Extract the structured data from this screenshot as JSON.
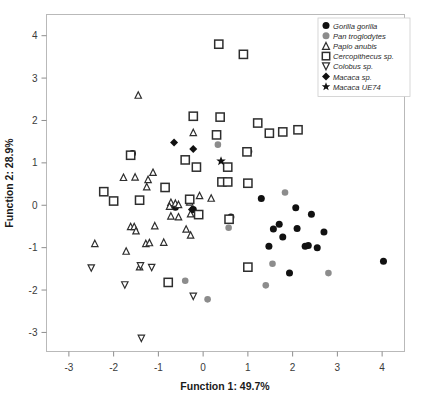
{
  "chart_data": {
    "type": "scatter",
    "title": "",
    "xlabel": "Function 1: 49.7%",
    "ylabel": "Function 2: 28.9%",
    "xlim": [
      -3.5,
      4.5
    ],
    "ylim": [
      -3.45,
      4.5
    ],
    "xticks": [
      -3,
      -2,
      -1,
      0,
      1,
      2,
      3,
      4
    ],
    "yticks": [
      -3,
      -2,
      -1,
      0,
      1,
      2,
      3,
      4
    ],
    "xtick_labels": [
      "-3",
      "-2",
      "-1",
      "0",
      "1",
      "2",
      "3",
      "4"
    ],
    "ytick_labels": [
      "-3",
      "-2",
      "-1",
      "0",
      "1",
      "2",
      "3",
      "4"
    ],
    "grid": false,
    "legend_position": "top-right",
    "series": [
      {
        "name": "Gorilla gorilla",
        "marker": "circle-filled",
        "color": "#111111",
        "size": 7.0,
        "points": [
          [
            -0.62,
            -0.05
          ],
          [
            -0.22,
            -0.1
          ],
          [
            0.62,
            -0.28
          ],
          [
            1.02,
            1.27
          ],
          [
            1.3,
            0.16
          ],
          [
            1.47,
            -0.97
          ],
          [
            1.57,
            -0.56
          ],
          [
            1.7,
            -0.45
          ],
          [
            1.78,
            -0.75
          ],
          [
            1.93,
            -1.6
          ],
          [
            2.07,
            -0.06
          ],
          [
            2.1,
            -0.55
          ],
          [
            2.28,
            -0.97
          ],
          [
            2.35,
            -0.95
          ],
          [
            2.42,
            -0.21
          ],
          [
            2.55,
            -1.0
          ],
          [
            2.7,
            -0.63
          ],
          [
            4.03,
            -1.32
          ],
          [
            -1.58,
            1.22
          ]
        ]
      },
      {
        "name": "Pan troglodytes",
        "marker": "circle-filled",
        "color": "#8c8c8c",
        "size": 6.6,
        "points": [
          [
            0.33,
            1.43
          ],
          [
            -0.4,
            -1.78
          ],
          [
            0.1,
            -2.22
          ],
          [
            0.57,
            -0.53
          ],
          [
            1.4,
            -1.89
          ],
          [
            1.55,
            -1.38
          ],
          [
            1.83,
            0.3
          ],
          [
            2.8,
            -1.6
          ]
        ]
      },
      {
        "name": "Papio anubis",
        "marker": "triangle-up-open",
        "color": "#2e2e2e",
        "size": 6.4,
        "points": [
          [
            -1.45,
            2.6
          ],
          [
            -0.22,
            1.72
          ],
          [
            -1.12,
            0.78
          ],
          [
            -1.78,
            0.66
          ],
          [
            -1.52,
            0.67
          ],
          [
            -1.23,
            0.61
          ],
          [
            -1.26,
            0.44
          ],
          [
            -0.72,
            0.07
          ],
          [
            -0.75,
            -0.02
          ],
          [
            -0.62,
            0.05
          ],
          [
            -0.55,
            0.02
          ],
          [
            -0.3,
            0.08
          ],
          [
            -0.08,
            0.23
          ],
          [
            0.18,
            0.17
          ],
          [
            -0.72,
            -0.25
          ],
          [
            -0.55,
            -0.27
          ],
          [
            -0.28,
            -0.2
          ],
          [
            -1.62,
            -0.5
          ],
          [
            -1.54,
            -0.5
          ],
          [
            -1.5,
            -0.6
          ],
          [
            -1.08,
            -0.48
          ],
          [
            -0.38,
            -0.56
          ],
          [
            -0.28,
            -0.7
          ],
          [
            -2.42,
            -0.9
          ],
          [
            -1.28,
            -0.9
          ],
          [
            -1.2,
            -0.88
          ],
          [
            -0.88,
            -0.87
          ],
          [
            -1.72,
            -1.08
          ],
          [
            -1.42,
            -1.45
          ]
        ]
      },
      {
        "name": "Cercopithecus sp.",
        "marker": "square-open",
        "color": "#2e2e2e",
        "size": 8.2,
        "points": [
          [
            0.35,
            3.8
          ],
          [
            0.9,
            3.56
          ],
          [
            -0.22,
            2.1
          ],
          [
            0.38,
            2.08
          ],
          [
            1.22,
            1.94
          ],
          [
            0.3,
            1.66
          ],
          [
            1.48,
            1.7
          ],
          [
            1.78,
            1.73
          ],
          [
            2.12,
            1.78
          ],
          [
            -1.62,
            1.18
          ],
          [
            -0.4,
            1.07
          ],
          [
            0.98,
            1.26
          ],
          [
            -0.15,
            0.9
          ],
          [
            0.55,
            0.9
          ],
          [
            0.42,
            0.55
          ],
          [
            0.55,
            0.55
          ],
          [
            1.0,
            0.52
          ],
          [
            -2.22,
            0.32
          ],
          [
            -0.85,
            0.42
          ],
          [
            -0.3,
            0.14
          ],
          [
            -2.0,
            0.1
          ],
          [
            -1.42,
            0.12
          ],
          [
            -0.1,
            -0.22
          ],
          [
            0.58,
            -0.33
          ],
          [
            1.0,
            -1.46
          ],
          [
            -0.78,
            -1.82
          ]
        ]
      },
      {
        "name": "Colobus sp.",
        "marker": "triangle-down-open",
        "color": "#2e2e2e",
        "size": 6.4,
        "points": [
          [
            -2.5,
            -1.48
          ],
          [
            -1.4,
            -1.43
          ],
          [
            -1.15,
            -1.47
          ],
          [
            -1.75,
            -1.88
          ],
          [
            -0.22,
            -2.15
          ],
          [
            -1.38,
            -3.14
          ]
        ]
      },
      {
        "name": "Macaca sp.",
        "marker": "diamond-filled",
        "color": "#111111",
        "size": 8.0,
        "points": [
          [
            -0.65,
            1.48
          ],
          [
            -0.22,
            1.33
          ],
          [
            -0.25,
            -0.1
          ]
        ]
      },
      {
        "name": "Macaca UE74",
        "marker": "star-filled",
        "color": "#111111",
        "size": 10.0,
        "points": [
          [
            0.4,
            1.04
          ]
        ]
      }
    ]
  },
  "legend": {
    "entries": [
      {
        "label": "Gorilla gorilla",
        "marker": "circle-filled",
        "color": "#111111"
      },
      {
        "label": "Pan troglodytes",
        "marker": "circle-filled",
        "color": "#8c8c8c"
      },
      {
        "label": "Papio anubis",
        "marker": "triangle-up-open",
        "color": "#2e2e2e"
      },
      {
        "label": "Cercopithecus sp.",
        "marker": "square-open",
        "color": "#2e2e2e"
      },
      {
        "label": "Colobus sp.",
        "marker": "triangle-down-open",
        "color": "#2e2e2e"
      },
      {
        "label": "Macaca sp.",
        "marker": "diamond-filled",
        "color": "#111111"
      },
      {
        "label": "Macaca UE74",
        "marker": "star-filled",
        "color": "#111111"
      }
    ]
  },
  "colors": {
    "frame": "#b9b9b9",
    "tick": "#8d8d8d",
    "text": "#1a1a1a",
    "background": "#ffffff"
  }
}
